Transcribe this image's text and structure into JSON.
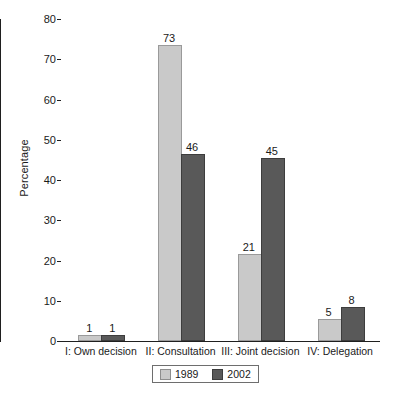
{
  "chart_data": {
    "type": "bar",
    "title": "",
    "subtitle": "",
    "xlabel": "",
    "ylabel": "Percentage",
    "ylim": [
      0,
      80
    ],
    "yticks": [
      0,
      10,
      20,
      30,
      40,
      50,
      60,
      70,
      80
    ],
    "ytick_labels": [
      "0",
      "10",
      "20",
      "30",
      "40",
      "50",
      "60",
      "70",
      "80"
    ],
    "grid": false,
    "legend_position": "bottom-center",
    "categories": [
      "I: Own decision",
      "II: Consultation",
      "III: Joint decision",
      "IV: Delegation"
    ],
    "series": [
      {
        "name": "1989",
        "color": "#c9c9c9",
        "values": [
          1,
          73,
          21,
          5
        ],
        "value_labels": [
          "1",
          "73",
          "21",
          "5"
        ]
      },
      {
        "name": "2002",
        "color": "#595959",
        "values": [
          1,
          46,
          45,
          8
        ],
        "value_labels": [
          "1",
          "46",
          "45",
          "8"
        ]
      }
    ]
  },
  "axis": {
    "y_title": "Percentage"
  },
  "legend": {
    "entries": [
      {
        "label": "1989",
        "swatch": "light"
      },
      {
        "label": "2002",
        "swatch": "dark"
      }
    ]
  }
}
